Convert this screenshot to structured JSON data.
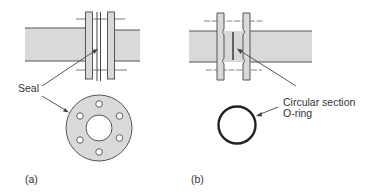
{
  "figure": {
    "panels": [
      {
        "id": "a",
        "label": "(a)",
        "title": "Flat gasket flange joint",
        "callouts": [
          {
            "text": "Seal"
          }
        ]
      },
      {
        "id": "b",
        "label": "(b)",
        "title": "O-ring flange joint",
        "callouts": [
          {
            "text_line1": "Circular section",
            "text_line2": "O-ring"
          }
        ]
      }
    ],
    "colors": {
      "pipe_fill": "#d9d9d9",
      "line": "#444444",
      "oring": "#222222",
      "text": "#333333"
    },
    "gasket_bolt_holes": 6
  }
}
